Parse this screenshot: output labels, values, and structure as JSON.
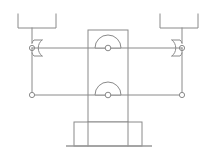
{
  "figure": {
    "background_color": "#ffffff",
    "stroke_color": "#8a8a8a",
    "ground_color": "#9a9a9a",
    "width": 216,
    "height": 154
  },
  "components": {
    "left_bracket": {
      "name": "left-upper-bracket",
      "label": "",
      "channel_left_x": 18,
      "channel_right_x": 56,
      "channel_top_y": 14,
      "channel_bottom_y": 28,
      "stem_x": 32,
      "stem_bottom_y": 43
    },
    "right_bracket": {
      "name": "right-upper-bracket",
      "label": "",
      "channel_left_x": 160,
      "channel_right_x": 198,
      "channel_top_y": 14,
      "channel_bottom_y": 28,
      "stem_x": 182,
      "stem_bottom_y": 43
    },
    "left_eye": {
      "name": "left-pivot-eye",
      "label": "",
      "center_x": 32,
      "center_y": 48,
      "hole_radius": 2.6,
      "body_radius": 10
    },
    "right_eye": {
      "name": "right-pivot-eye",
      "label": "",
      "center_x": 182,
      "center_y": 48,
      "hole_radius": 2.6,
      "body_radius": 10
    },
    "left_lower_joint": {
      "name": "left-lower-joint",
      "label": "",
      "center_x": 32,
      "center_y": 95,
      "hole_radius": 2.6
    },
    "right_lower_joint": {
      "name": "right-lower-joint",
      "label": "",
      "center_x": 182,
      "center_y": 95,
      "hole_radius": 2.6
    },
    "center_plate": {
      "name": "center-vertical-plate",
      "label": "",
      "left_x": 88,
      "right_x": 128,
      "top_y": 30,
      "bottom_y": 122,
      "upper_pivot_x": 108,
      "upper_pivot_y": 48,
      "lower_pivot_x": 108,
      "lower_pivot_y": 95,
      "arch_radius": 13,
      "hole_radius": 2.8
    },
    "upper_link": {
      "name": "upper-horizontal-link",
      "label": "",
      "from_x": 32,
      "to_x": 182,
      "y": 48
    },
    "lower_link": {
      "name": "lower-horizontal-link",
      "label": "",
      "from_x": 32,
      "to_x": 182,
      "y": 95
    },
    "left_side_link": {
      "name": "left-vertical-link",
      "label": "",
      "x": 32,
      "from_y": 48,
      "to_y": 95
    },
    "right_side_link": {
      "name": "right-vertical-link",
      "label": "",
      "x": 182,
      "from_y": 48,
      "to_y": 95
    },
    "base": {
      "name": "base-block",
      "label": "",
      "left_x": 74,
      "right_x": 142,
      "top_y": 122,
      "bottom_y": 146
    },
    "ground": {
      "name": "ground-line",
      "label": "",
      "from_x": 66,
      "to_x": 152,
      "y": 146
    }
  }
}
